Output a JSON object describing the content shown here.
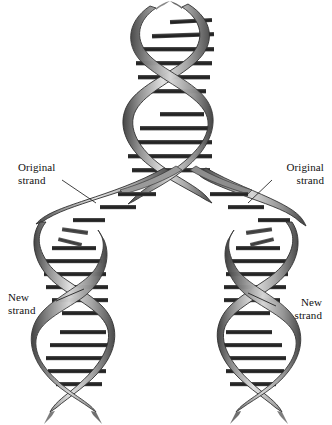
{
  "figure": {
    "background_color": "#ffffff",
    "width": 332,
    "height": 425
  },
  "colors": {
    "background": "#ffffff",
    "ribbon_light": "#d8d8d8",
    "ribbon_mid": "#a8a8a8",
    "ribbon_dark": "#6e6e6e",
    "ribbon_edge": "#3a3a3a",
    "rung_dark": "#2b2b2b",
    "rung_mid": "#4d4d4d",
    "leader_line": "#111111",
    "text": "#111111"
  },
  "labels": {
    "original_left": {
      "line1": "Original",
      "line2": "strand"
    },
    "original_right": {
      "line1": "Original",
      "line2": "strand"
    },
    "new_left": {
      "line1": "New",
      "line2": "strand"
    },
    "new_right": {
      "line1": "New",
      "line2": "strand"
    }
  },
  "diagram": {
    "parent_helix_label": "parent-double-helix",
    "fork_label": "replication-fork",
    "left_daughter_label": "left-daughter-helix",
    "right_daughter_label": "right-daughter-helix"
  }
}
